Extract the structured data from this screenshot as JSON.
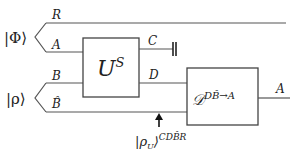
{
  "diagram": {
    "type": "quantum-circuit",
    "input_states": [
      {
        "label": "|Φ⟩",
        "wires": [
          "R",
          "A"
        ]
      },
      {
        "label": "|ρ⟩",
        "wires": [
          "B",
          "B̂"
        ]
      }
    ],
    "wires": {
      "R": "R",
      "A_in": "A",
      "B": "B",
      "B_hat": "B̂",
      "C": "C",
      "D": "D",
      "A_out": "A"
    },
    "gates": {
      "unitary": {
        "base": "U",
        "sup": "S"
      },
      "decoder": {
        "base": "𝒟",
        "sup": "DB̂→A"
      }
    },
    "annotation": {
      "base": "|ρ",
      "sub": "U",
      "close": "⟩",
      "sup": "CDB̂R"
    },
    "discard_symbol": "trash"
  }
}
